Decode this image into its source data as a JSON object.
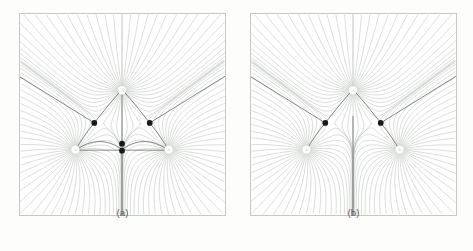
{
  "figure": {
    "type": "two-panel-field-line-diagram",
    "background_color": "#fdfdfc",
    "panel_border_color": "#c6c8c4",
    "fieldline_color": "#c3c8c2",
    "separatrix_color": "#6f7370",
    "saddle_color": "#16181a"
  },
  "panels": [
    {
      "id": "a",
      "caption": "(a)",
      "sources": [
        {
          "label": "A",
          "x": 103,
          "y": 77
        },
        {
          "label": "a",
          "x": 56,
          "y": 137
        },
        {
          "label": "b",
          "x": 150,
          "y": 137
        }
      ],
      "saddles": [
        {
          "x": 75,
          "y": 110
        },
        {
          "x": 131,
          "y": 110
        },
        {
          "x": 103,
          "y": 131
        },
        {
          "x": 103,
          "y": 138
        }
      ],
      "has_horizontal_separatrix": true,
      "has_vertical_spine": true,
      "saddle_count": 4
    },
    {
      "id": "b",
      "caption": "(b)",
      "sources": [
        {
          "label": "A",
          "x": 103,
          "y": 77
        },
        {
          "label": "a",
          "x": 56,
          "y": 137
        },
        {
          "label": "b",
          "x": 150,
          "y": 137
        }
      ],
      "saddles": [
        {
          "x": 75,
          "y": 110
        },
        {
          "x": 131,
          "y": 110
        }
      ],
      "has_horizontal_separatrix": false,
      "has_vertical_spine": true,
      "saddle_count": 2
    }
  ]
}
